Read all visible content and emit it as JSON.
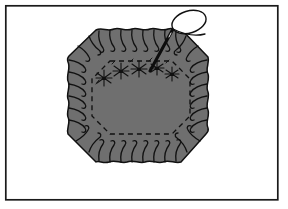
{
  "figure": {
    "alt_text": "Line drawing of a gray octagonal fabric piece with a ruffled gathered edge, an inner dashed stitching line, small star tack stitches along the top, and a threaded needle with an oval loop of thread at the upper right",
    "medium": "black-and-white line art with flat gray fill"
  },
  "frame": {
    "name": "border-frame",
    "stroke_color": "#1a1a1a",
    "stroke_width": 1.6,
    "fill_color": "#ffffff",
    "x": 5,
    "y": 5,
    "width": 273,
    "height": 195
  },
  "colors": {
    "ink": "#111111",
    "fabric_fill": "#6f6f6f",
    "fabric_fill_light": "#7b7b7b",
    "thread_fill": "#ffffff",
    "page_background": "#ffffff",
    "frame_stroke": "#1a1a1a"
  },
  "fabric": {
    "name": "octagonal-fabric-body",
    "shape": "octagon",
    "fill": "#6f6f6f",
    "stroke": "#111111",
    "stroke_width": 1.5,
    "bounds": {
      "x": 66,
      "y": 28,
      "width": 144,
      "height": 136
    },
    "outline_points": [
      [
        96,
        30
      ],
      [
        180,
        30
      ],
      [
        208,
        58
      ],
      [
        208,
        132
      ],
      [
        180,
        162
      ],
      [
        96,
        162
      ],
      [
        68,
        132
      ],
      [
        68,
        58
      ]
    ],
    "corner_cut": "diagonal bevel at all four corners"
  },
  "stitch_line": {
    "name": "inner-dashed-stitch-line",
    "style": "dashed",
    "dash_pattern": "5 4",
    "stroke": "#111111",
    "stroke_width": 1.3,
    "points": [
      [
        110,
        61
      ],
      [
        172,
        61
      ],
      [
        190,
        79
      ],
      [
        190,
        116
      ],
      [
        172,
        134
      ],
      [
        110,
        134
      ],
      [
        92,
        116
      ],
      [
        92,
        79
      ]
    ]
  },
  "ruffle": {
    "name": "gathered-edge-pleats",
    "description": "hook-shaped gather lines radiating inward from the outer edge",
    "stroke": "#111111",
    "stroke_width": 1.3,
    "count_top": 11,
    "count_bottom": 11,
    "count_left": 7,
    "count_right": 7
  },
  "tack_stitches": {
    "name": "star-tack-stitches",
    "description": "small asterisk-shaped tacking stitches along the upper stitch line",
    "stroke": "#111111",
    "count": 5,
    "positions": [
      [
        104,
        76
      ],
      [
        120,
        70
      ],
      [
        137,
        68
      ],
      [
        155,
        67
      ],
      [
        171,
        72
      ]
    ]
  },
  "needle": {
    "name": "sewing-needle",
    "stroke": "#0d0d0d",
    "stroke_width": 2.6,
    "from": [
      172,
      30
    ],
    "to": [
      150,
      70
    ],
    "eye_end": [
      172,
      30
    ],
    "point_end": [
      150,
      70
    ]
  },
  "thread": {
    "name": "thread-loop",
    "shape": "oval loop",
    "stroke": "#111111",
    "stroke_width": 1.4,
    "fill": "#ffffff",
    "loop_center": [
      189,
      22
    ],
    "loop_rx": 17,
    "loop_ry": 11,
    "loop_rotation_deg": -18,
    "tail_points": [
      [
        172,
        30
      ],
      [
        196,
        35
      ],
      [
        205,
        33
      ]
    ]
  },
  "labels": {
    "figure_caption": "",
    "annotations": []
  }
}
